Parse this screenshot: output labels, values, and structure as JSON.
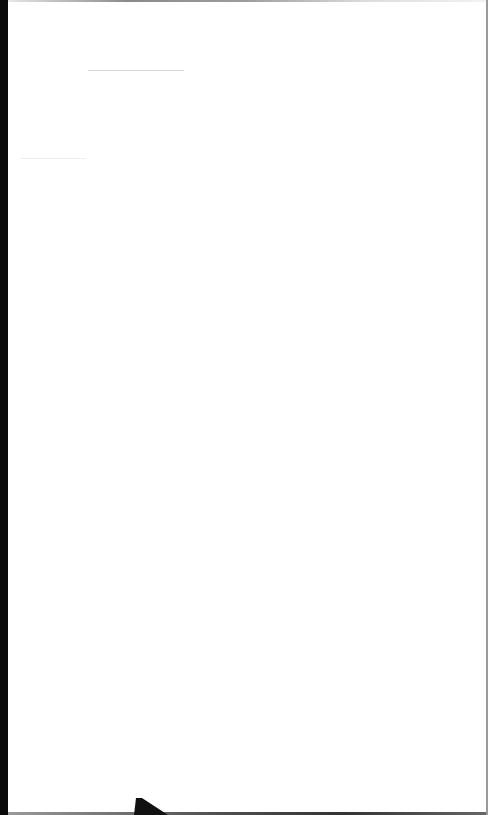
{
  "document": {
    "type": "blank-page",
    "background_color": "#ffffff",
    "edge_color": "#0a0a0a",
    "text_content": ""
  }
}
